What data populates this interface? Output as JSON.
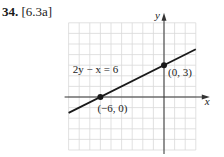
{
  "problem": {
    "number": "34.",
    "reference": "[6.3a]"
  },
  "chart_data": {
    "type": "line",
    "title": "",
    "xlabel": "x",
    "ylabel": "y",
    "xlim": [
      -9,
      3
    ],
    "ylim": [
      -5,
      7
    ],
    "grid": true,
    "equation_label": "2y − x = 6",
    "line": {
      "slope": 0.5,
      "intercept": 3,
      "x_range": [
        -9,
        3
      ]
    },
    "points": [
      {
        "x": -6,
        "y": 0,
        "label": "(−6, 0)"
      },
      {
        "x": 0,
        "y": 3,
        "label": "(0, 3)"
      }
    ],
    "colors": {
      "grid": "#d9d9d9",
      "axis": "#333333",
      "line": "#1a1a1a"
    }
  }
}
